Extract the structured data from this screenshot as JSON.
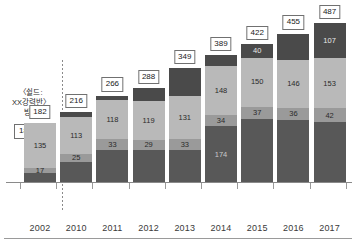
{
  "annotation": {
    "text_line1": "〈쉴드:",
    "text_line2": "XX강력반〉",
    "text_line3": "방송",
    "value_label": "182"
  },
  "chart_data": {
    "type": "bar",
    "stacked": true,
    "title": "",
    "subtitle": "",
    "xlabel": "",
    "ylabel": "",
    "grid": false,
    "legend_position": "none",
    "ylim": [
      0,
      487
    ],
    "categories": [
      "2002",
      "2010",
      "2011",
      "2012",
      "2013",
      "2014",
      "2015",
      "2016",
      "2017"
    ],
    "totals": [
      182,
      216,
      266,
      288,
      349,
      389,
      422,
      455,
      487
    ],
    "series": [
      {
        "name": "segment-bottom",
        "color": "#585858",
        "values": [
          30,
          63,
          101,
          102,
          101,
          174,
          195,
          193,
          185
        ]
      },
      {
        "name": "segment-mid",
        "color": "#9a9a9a",
        "values": [
          17,
          25,
          33,
          29,
          33,
          34,
          37,
          36,
          42
        ]
      },
      {
        "name": "segment-light",
        "color": "#b9b9b9",
        "values": [
          135,
          113,
          118,
          119,
          131,
          148,
          150,
          146,
          153
        ]
      },
      {
        "name": "segment-top",
        "color": "#4a4a4a",
        "values": [
          0,
          15,
          14,
          38,
          84,
          33,
          40,
          80,
          107
        ]
      }
    ],
    "bar_labels": {
      "2002": [
        "",
        "17",
        "135",
        ""
      ],
      "2010": [
        "",
        "25",
        "113",
        ""
      ],
      "2011": [
        "",
        "33",
        "118",
        ""
      ],
      "2012": [
        "",
        "29",
        "119",
        ""
      ],
      "2013": [
        "",
        "33",
        "131",
        ""
      ],
      "2014": [
        "174",
        "34",
        "148",
        ""
      ],
      "2015": [
        "",
        "37",
        "150",
        "40"
      ],
      "2016": [
        "",
        "36",
        "146",
        ""
      ],
      "2017": [
        "",
        "42",
        "153",
        "107"
      ]
    }
  }
}
